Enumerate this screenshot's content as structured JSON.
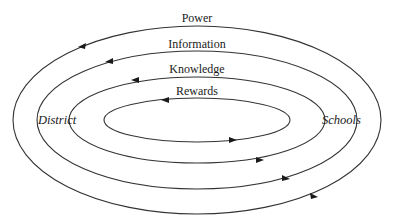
{
  "diagram": {
    "type": "concentric-flow-ellipses",
    "nodes": {
      "left": "District",
      "right": "Schools"
    },
    "flows": [
      {
        "label": "Power",
        "direction": "top: Schools→District, bottom: District→Schools"
      },
      {
        "label": "Information",
        "direction": "top: Schools→District, bottom: District→Schools"
      },
      {
        "label": "Knowledge",
        "direction": "top: Schools→District, bottom: District→Schools"
      },
      {
        "label": "Rewards",
        "direction": "top: Schools→District, bottom: District→Schools"
      }
    ]
  }
}
